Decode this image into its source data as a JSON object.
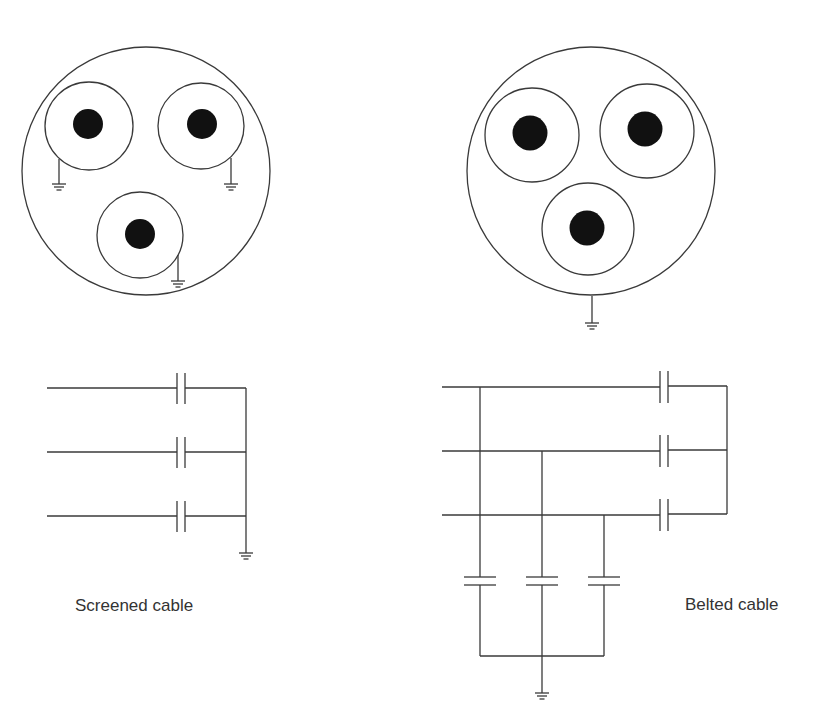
{
  "diagram": {
    "type": "cable cross-section and equivalent capacitance circuits",
    "panels": [
      {
        "id": "screened",
        "label": "Screened cable",
        "cross_section": {
          "conductors": 3,
          "each_core_individually_screened": true,
          "earth_connections": 3
        },
        "circuit": {
          "phase_lines": 3,
          "capacitors_to_earth": 3,
          "phase_to_phase_capacitors": 0,
          "earth_symbol": 1
        }
      },
      {
        "id": "belted",
        "label": "Belted cable",
        "cross_section": {
          "conductors": 3,
          "common_belt": true,
          "earth_connections": 1
        },
        "circuit": {
          "phase_lines": 3,
          "capacitors_to_earth": 3,
          "phase_to_phase_capacitors": 3,
          "earth_symbol": 1
        }
      }
    ],
    "colors": {
      "line": "#3a3a3a",
      "core": "#111111",
      "text": "#333333",
      "background": "#ffffff"
    }
  }
}
